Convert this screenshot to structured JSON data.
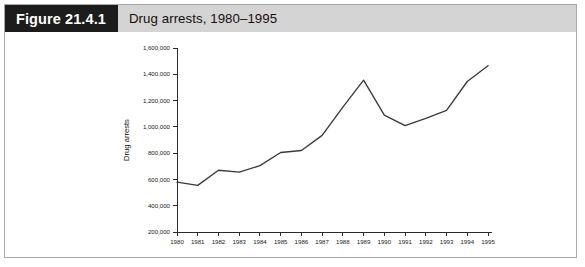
{
  "figure": {
    "number_label": "Figure 21.4.1",
    "caption": "Drug arrests, 1980–1995"
  },
  "colors": {
    "header_bar": "#d4d4d4",
    "number_box": "#1c1c1c",
    "frame_border": "#a9a9a9",
    "line": "#3a3a3a",
    "axis": "#2b2b2b",
    "background": "#ffffff"
  },
  "chart_data": {
    "type": "line",
    "title": "Drug arrests, 1980–1995",
    "xlabel": "",
    "ylabel": "Drug arrests",
    "x": [
      1980,
      1981,
      1982,
      1983,
      1984,
      1985,
      1986,
      1987,
      1988,
      1989,
      1990,
      1991,
      1992,
      1993,
      1994,
      1995
    ],
    "categories": [
      "1980",
      "1981",
      "1982",
      "1983",
      "1984",
      "1985",
      "1986",
      "1987",
      "1988",
      "1989",
      "1990",
      "1991",
      "1992",
      "1993",
      "1994",
      "1995"
    ],
    "values": [
      580000,
      555000,
      670000,
      655000,
      705000,
      805000,
      820000,
      935000,
      1150000,
      1355000,
      1090000,
      1010000,
      1065000,
      1125000,
      1345000,
      1465000
    ],
    "series": [
      {
        "name": "Drug arrests",
        "values": [
          580000,
          555000,
          670000,
          655000,
          705000,
          805000,
          820000,
          935000,
          1150000,
          1355000,
          1090000,
          1010000,
          1065000,
          1125000,
          1345000,
          1465000
        ]
      }
    ],
    "ylim": [
      200000,
      1600000
    ],
    "ytick_values": [
      200000,
      400000,
      600000,
      800000,
      1000000,
      1200000,
      1400000,
      1600000
    ],
    "ytick_labels": [
      "200,000",
      "400,000",
      "600,000",
      "800,000",
      "1,000,000",
      "1,200,000",
      "1,400,000",
      "1,600,000"
    ],
    "xtick_labels": [
      "1980",
      "1981",
      "1982",
      "1983",
      "1984",
      "1985",
      "1986",
      "1987",
      "1988",
      "1989",
      "1990",
      "1991",
      "1992",
      "1993",
      "1994",
      "1995"
    ],
    "grid": false,
    "legend": false,
    "legend_position": "none"
  }
}
